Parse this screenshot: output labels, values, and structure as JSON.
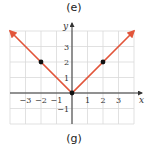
{
  "labels": {
    "top": "(e)",
    "bottom": "(g)"
  },
  "colors": {
    "line": "#e2553a",
    "grid": "#d9d9d9",
    "axis": "#333333",
    "point": "#111111"
  },
  "chart_data": {
    "type": "line",
    "title": "",
    "function": "y = |x|",
    "xlabel": "x",
    "ylabel": "y",
    "xlim": [
      -4,
      4
    ],
    "ylim": [
      -2,
      4
    ],
    "grid": true,
    "x_ticks": [
      -3,
      -2,
      -1,
      1,
      2,
      3
    ],
    "y_ticks": [
      -1,
      1,
      2,
      3
    ],
    "series": [
      {
        "name": "y = |x|",
        "x": [
          -4,
          0,
          4
        ],
        "y": [
          4,
          0,
          4
        ],
        "arrows": "both"
      }
    ],
    "points": [
      {
        "x": -2,
        "y": 2
      },
      {
        "x": 0,
        "y": 0
      },
      {
        "x": 2,
        "y": 2
      }
    ]
  }
}
